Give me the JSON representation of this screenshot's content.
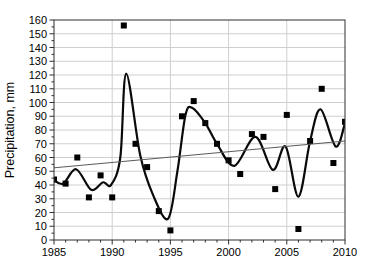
{
  "figure": {
    "width": 367,
    "height": 268,
    "background": "#ffffff"
  },
  "colors": {
    "frame": "#2f2f2f",
    "grid": "#cfcfcf",
    "text": "#000000",
    "marker": "#000000",
    "spline": "#0a0a0a",
    "trend": "#5a5a5a"
  },
  "chart_data": {
    "type": "scatter",
    "title": "",
    "xlabel": "",
    "ylabel": "Precipitation, mm",
    "xlim": [
      1985,
      2010
    ],
    "ylim": [
      0,
      160
    ],
    "x_ticks": [
      1985,
      1990,
      1995,
      2000,
      2005,
      2010
    ],
    "x_minor_step": 1,
    "y_ticks": [
      0,
      10,
      20,
      30,
      40,
      50,
      60,
      70,
      80,
      90,
      100,
      110,
      120,
      130,
      140,
      150,
      160
    ],
    "y_minor_step": 5,
    "grid": true,
    "grid_x_at_major": true,
    "legend": "none",
    "series": [
      {
        "name": "annual precipitation points",
        "type": "scatter",
        "marker": "square",
        "marker_size": 6,
        "color": "#000000",
        "x": [
          1985,
          1986,
          1987,
          1988,
          1989,
          1990,
          1991,
          1992,
          1993,
          1994,
          1995,
          1996,
          1997,
          1998,
          1999,
          2000,
          2001,
          2002,
          2003,
          2004,
          2005,
          2006,
          2007,
          2008,
          2009,
          2010
        ],
        "y": [
          44,
          41,
          60,
          31,
          47,
          31,
          156,
          70,
          53,
          21,
          7,
          90,
          101,
          85,
          70,
          58,
          48,
          77,
          75,
          37,
          91,
          8,
          72,
          110,
          56,
          86
        ]
      },
      {
        "name": "smoothed curve",
        "type": "spline",
        "color": "#0a0a0a",
        "width": 2.2,
        "points": [
          [
            1985.0,
            43.5
          ],
          [
            1985.8,
            41.0
          ],
          [
            1986.9,
            51.5
          ],
          [
            1988.2,
            36.5
          ],
          [
            1989.2,
            42.0
          ],
          [
            1989.9,
            40.0
          ],
          [
            1990.7,
            60.0
          ],
          [
            1991.2,
            121.0
          ],
          [
            1992.4,
            62.0
          ],
          [
            1993.5,
            33.0
          ],
          [
            1994.8,
            15.5
          ],
          [
            1995.6,
            50.0
          ],
          [
            1996.3,
            91.0
          ],
          [
            1996.9,
            96.0
          ],
          [
            1998.0,
            85.0
          ],
          [
            1999.0,
            70.0
          ],
          [
            2000.5,
            54.0
          ],
          [
            2002.3,
            75.0
          ],
          [
            2003.8,
            51.0
          ],
          [
            2004.9,
            68.0
          ],
          [
            2006.0,
            31.5
          ],
          [
            2007.0,
            72.0
          ],
          [
            2007.9,
            95.0
          ],
          [
            2009.2,
            68.0
          ],
          [
            2010.0,
            85.0
          ]
        ]
      },
      {
        "name": "linear trend line",
        "type": "line",
        "color": "#5a5a5a",
        "width": 1,
        "points": [
          [
            1985,
            52.5
          ],
          [
            2010,
            72.0
          ]
        ]
      }
    ]
  }
}
